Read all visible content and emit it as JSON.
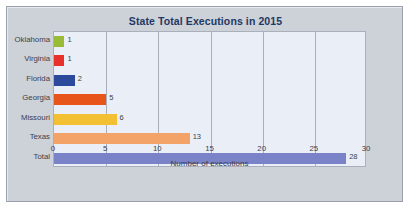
{
  "chart_data": {
    "type": "bar",
    "orientation": "horizontal",
    "title": "State Total Executions in 2015",
    "xlabel": "Number of executions",
    "ylabel": "",
    "xlim": [
      0,
      30
    ],
    "xticks": [
      "0",
      "5",
      "10",
      "15",
      "20",
      "25",
      "30"
    ],
    "grid": "vertical",
    "legend": "none",
    "categories": [
      "Oklahoma",
      "Virginia",
      "Florida",
      "Georgia",
      "Missouri",
      "Texas",
      "Total"
    ],
    "values": [
      1,
      1,
      2,
      5,
      6,
      13,
      28
    ],
    "value_labels": [
      "1",
      "1",
      "2",
      "5",
      "6",
      "13",
      "28"
    ],
    "bar_colors": [
      "#9ABB38",
      "#E8312A",
      "#2B4A9B",
      "#E8551B",
      "#F2C032",
      "#F4A368",
      "#7A83C8"
    ],
    "background_color": "#EAEFF7",
    "panel_color": "#CDD1D8",
    "title_color": "#1F3864",
    "axis_text_color": "#3D4049",
    "gridline_color": "#A9B0BB"
  }
}
